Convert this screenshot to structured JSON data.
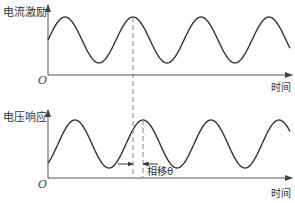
{
  "diagram": {
    "top_plot": {
      "ylabel": "电流激励",
      "xlabel": "时间",
      "origin": "O"
    },
    "bottom_plot": {
      "ylabel": "电压响应",
      "xlabel": "时间",
      "origin": "O"
    },
    "annotation": {
      "phase_shift_label": "相移θ"
    },
    "colors": {
      "curve": "#333333",
      "axis": "#555555",
      "dashed": "#888888"
    }
  }
}
